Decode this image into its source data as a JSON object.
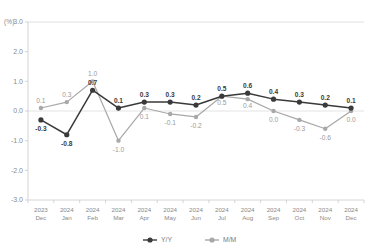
{
  "chart_data": {
    "type": "line",
    "title": "",
    "xlabel": "",
    "ylabel": "(%)",
    "unit": "(%)",
    "ylim": [
      -3.0,
      3.0
    ],
    "ytick_labels": [
      "3.0",
      "2.0",
      "1.0",
      "0.0",
      "-1.0",
      "-2.0",
      "-3.0"
    ],
    "ytick_values": [
      3.0,
      2.0,
      1.0,
      0.0,
      -1.0,
      -2.0,
      -3.0
    ],
    "grid": false,
    "zero_line": true,
    "legend_position": "bottom",
    "categories": [
      "2023\nDec",
      "2024\nJan",
      "2024\nFeb",
      "2024\nMar",
      "2024\nApr",
      "2024\nMay",
      "2024\nJun",
      "2024\nJul",
      "2024\nAug",
      "2024\nSep",
      "2024\nOct",
      "2024\nNov",
      "2024\nDec"
    ],
    "category_years": [
      "2023",
      "2024",
      "2024",
      "2024",
      "2024",
      "2024",
      "2024",
      "2024",
      "2024",
      "2024",
      "2024",
      "2024",
      "2024"
    ],
    "category_months": [
      "Dec",
      "Jan",
      "Feb",
      "Mar",
      "Apr",
      "May",
      "Jun",
      "Jul",
      "Aug",
      "Sep",
      "Oct",
      "Nov",
      "Dec"
    ],
    "series": [
      {
        "name": "Y/Y",
        "color": "#3a3a3a",
        "values": [
          -0.3,
          -0.8,
          0.7,
          0.1,
          0.3,
          0.3,
          0.2,
          0.5,
          0.6,
          0.4,
          0.3,
          0.2,
          0.1
        ],
        "labels": [
          "-0.3",
          "-0.8",
          "0.7",
          "0.1",
          "0.3",
          "0.3",
          "0.2",
          "0.5",
          "0.6",
          "0.4",
          "0.3",
          "0.2",
          "0.1"
        ]
      },
      {
        "name": "M/M",
        "color": "#a8a8a8",
        "values": [
          0.1,
          0.3,
          1.0,
          -1.0,
          0.1,
          -0.1,
          -0.2,
          0.5,
          0.4,
          0.0,
          -0.3,
          -0.6,
          0.0
        ],
        "labels": [
          "0.1",
          "0.3",
          "1.0",
          "-1.0",
          "0.1",
          "-0.1",
          "-0.2",
          "0.5",
          "0.4",
          "0.0",
          "-0.3",
          "-0.6",
          "0.0"
        ]
      }
    ]
  },
  "legend": {
    "items": [
      {
        "label": "Y/Y",
        "color": "#3a3a3a"
      },
      {
        "label": "M/M",
        "color": "#a8a8a8"
      }
    ]
  }
}
